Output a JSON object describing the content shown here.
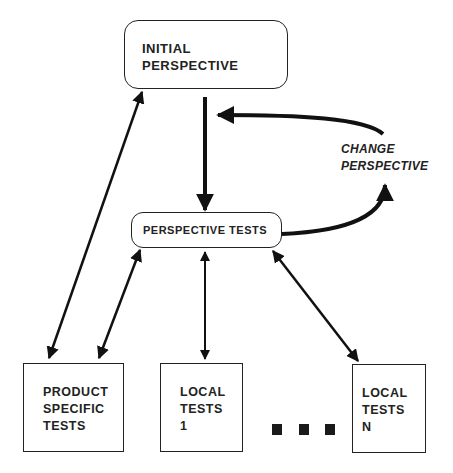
{
  "diagram": {
    "type": "flowchart",
    "nodes": {
      "initial": {
        "label": "INITIAL\nPERSPECTIVE",
        "shape": "rounded-rect"
      },
      "perspective_tests": {
        "label": "PERSPECTIVE TESTS",
        "shape": "rounded-rect"
      },
      "product_specific": {
        "label": "PRODUCT\nSPECIFIC\nTESTS",
        "shape": "rect"
      },
      "local_1": {
        "label": "LOCAL\nTESTS\n1",
        "shape": "rect"
      },
      "local_n": {
        "label": "LOCAL\nTESTS\nN",
        "shape": "rect"
      }
    },
    "edge_labels": {
      "change_perspective": "CHANGE\nPERSPECTIVE"
    },
    "ellipsis": [
      "■",
      "■",
      "■"
    ],
    "edges": [
      {
        "from": "initial",
        "to": "perspective_tests",
        "direction": "one-way"
      },
      {
        "from": "perspective_tests",
        "to": "initial",
        "direction": "one-way",
        "label": "CHANGE PERSPECTIVE",
        "style": "curved-loop"
      },
      {
        "from": "initial",
        "to": "product_specific",
        "direction": "two-way"
      },
      {
        "from": "perspective_tests",
        "to": "product_specific",
        "direction": "two-way"
      },
      {
        "from": "perspective_tests",
        "to": "local_1",
        "direction": "two-way"
      },
      {
        "from": "perspective_tests",
        "to": "local_n",
        "direction": "two-way"
      }
    ]
  }
}
